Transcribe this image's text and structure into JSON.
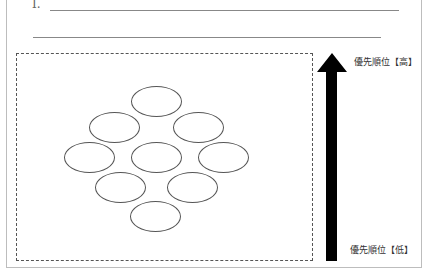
{
  "worksheet": {
    "item_number": "I.",
    "answer_lines": 2
  },
  "priority_diagram": {
    "label_high": "優先順位【高】",
    "label_low": "優先順位【低】",
    "arrow_color": "#000000",
    "ellipse_count": 9,
    "ellipses": [
      {
        "row": 1,
        "x": 131,
        "y": 86
      },
      {
        "row": 2,
        "x": 89,
        "y": 112
      },
      {
        "row": 2,
        "x": 173,
        "y": 112
      },
      {
        "row": 3,
        "x": 64,
        "y": 142
      },
      {
        "row": 3,
        "x": 131,
        "y": 142
      },
      {
        "row": 3,
        "x": 198,
        "y": 142
      },
      {
        "row": 4,
        "x": 95,
        "y": 172
      },
      {
        "row": 4,
        "x": 167,
        "y": 172
      },
      {
        "row": 5,
        "x": 130,
        "y": 201
      }
    ]
  }
}
